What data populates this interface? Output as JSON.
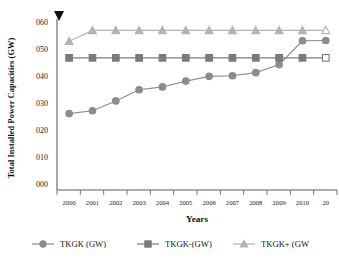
{
  "chart_data": {
    "type": "line",
    "title": "",
    "xlabel": "Years",
    "ylabel": "Total Installed Power Capacities (GW)",
    "categories": [
      "2000",
      "2001",
      "2002",
      "2003",
      "2004",
      "2005",
      "2006",
      "2007",
      "2008",
      "2009",
      "2010",
      "20"
    ],
    "x_tick_labels": [
      "2000",
      "2001",
      "2002",
      "2003",
      "2004",
      "2005",
      "2006",
      "2007",
      "2008",
      "2009",
      "2010",
      "20"
    ],
    "y_tick_labels": [
      "000",
      "010",
      "020",
      "030",
      "040",
      "050",
      "060"
    ],
    "y_tick_values": [
      0,
      10,
      20,
      30,
      40,
      50,
      60
    ],
    "ylim": [
      0,
      60
    ],
    "grid": false,
    "legend_position": "bottom",
    "note_marker": "▼",
    "series": [
      {
        "name": "TKGK (GW)",
        "marker": "circle",
        "color": "#8c8c8c",
        "last_point_open": false,
        "values": [
          27.3,
          28.3,
          31.8,
          35.8,
          36.8,
          38.9,
          40.6,
          40.8,
          41.9,
          44.8,
          53.3,
          53.4
        ]
      },
      {
        "name": "TKGK-(GW)",
        "marker": "square",
        "color": "#7a7a7a",
        "last_point_open": true,
        "values": [
          47.2,
          47.2,
          47.2,
          47.2,
          47.2,
          47.2,
          47.2,
          47.2,
          47.2,
          47.2,
          47.2,
          47.2
        ]
      },
      {
        "name": "TKGK+ (GW",
        "marker": "triangle",
        "color": "#b3b3b3",
        "last_point_open": true,
        "values": [
          53.1,
          57.0,
          57.0,
          57.0,
          57.0,
          57.0,
          57.0,
          57.0,
          57.0,
          57.0,
          57.0,
          57.0
        ]
      }
    ]
  },
  "legend": {
    "items": [
      {
        "label": "TKGK (GW)",
        "marker": "circle-marker"
      },
      {
        "label": "TKGK-(GW)",
        "marker": "square-marker"
      },
      {
        "label": "TKGK+ (GW",
        "marker": "triangle-marker"
      }
    ]
  }
}
